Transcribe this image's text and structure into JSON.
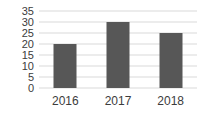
{
  "chart_data": {
    "type": "bar",
    "categories": [
      "2016",
      "2017",
      "2018"
    ],
    "values": [
      20,
      30,
      25
    ],
    "title": "",
    "xlabel": "",
    "ylabel": "",
    "ylim": [
      0,
      35
    ],
    "yticks": [
      0,
      5,
      10,
      15,
      20,
      25,
      30,
      35
    ],
    "grid": true,
    "legend_position": "none",
    "bar_color": "#575757",
    "grid_color": "#d9d9d9",
    "axis_text_color": "#3c3c3c",
    "background_color": "#ffffff"
  }
}
